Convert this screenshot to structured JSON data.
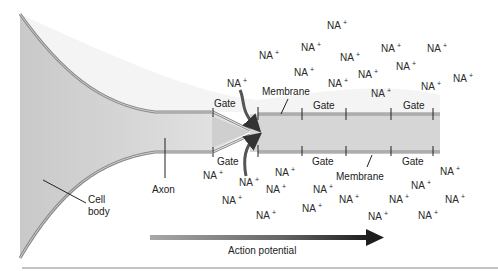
{
  "diagram": {
    "labels": {
      "cell_body_line1": "Cell",
      "cell_body_line2": "body",
      "axon": "Axon",
      "membrane_top": "Membrane",
      "membrane_bottom": "Membrane",
      "action_potential": "Action potential"
    },
    "gates_top": [
      {
        "label": "Gate",
        "x": 214,
        "y": 107
      },
      {
        "label": "Gate",
        "x": 313,
        "y": 109
      },
      {
        "label": "Gate",
        "x": 403,
        "y": 109
      }
    ],
    "gates_bottom": [
      {
        "label": "Gate",
        "x": 217,
        "y": 165
      },
      {
        "label": "Gate",
        "x": 312,
        "y": 165
      },
      {
        "label": "Gate",
        "x": 402,
        "y": 165
      }
    ],
    "ion_label": "NA",
    "ion_charge": "+",
    "ions_outside_top": [
      {
        "x": 327,
        "y": 29
      },
      {
        "x": 301,
        "y": 51
      },
      {
        "x": 340,
        "y": 61
      },
      {
        "x": 381,
        "y": 52
      },
      {
        "x": 427,
        "y": 52
      },
      {
        "x": 259,
        "y": 59
      },
      {
        "x": 294,
        "y": 76
      },
      {
        "x": 358,
        "y": 78
      },
      {
        "x": 396,
        "y": 70
      },
      {
        "x": 227,
        "y": 87
      },
      {
        "x": 328,
        "y": 87
      },
      {
        "x": 371,
        "y": 97
      },
      {
        "x": 421,
        "y": 90
      },
      {
        "x": 453,
        "y": 82
      }
    ],
    "ions_outside_bottom": [
      {
        "x": 203,
        "y": 179
      },
      {
        "x": 239,
        "y": 186
      },
      {
        "x": 275,
        "y": 176
      },
      {
        "x": 222,
        "y": 204
      },
      {
        "x": 256,
        "y": 219
      },
      {
        "x": 266,
        "y": 193
      },
      {
        "x": 302,
        "y": 212
      },
      {
        "x": 313,
        "y": 193
      },
      {
        "x": 339,
        "y": 203
      },
      {
        "x": 368,
        "y": 220
      },
      {
        "x": 389,
        "y": 203
      },
      {
        "x": 411,
        "y": 189
      },
      {
        "x": 418,
        "y": 219
      },
      {
        "x": 440,
        "y": 175
      },
      {
        "x": 445,
        "y": 203
      }
    ],
    "colors": {
      "axon_interior": "#d4d4d4",
      "membrane": "#8a8a8a",
      "arrow_dark": "#1e1e1e",
      "arrow_light": "#a8a8a8",
      "text": "#222222"
    }
  }
}
